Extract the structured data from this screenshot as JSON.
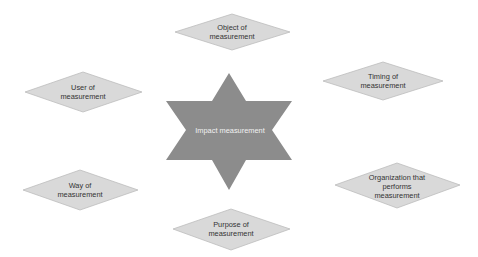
{
  "diagram": {
    "center": {
      "label": "Impact measurement",
      "shape": "six-pointed-star",
      "fill": "#8c8c8c",
      "text_color": "#f2f2f2"
    },
    "nodes": [
      {
        "id": "object",
        "label": "Object of measurement",
        "shape": "diamond"
      },
      {
        "id": "timing",
        "label": "Timing of measurement",
        "shape": "diamond"
      },
      {
        "id": "organization",
        "label": "Organization that performs measurement",
        "shape": "diamond"
      },
      {
        "id": "purpose",
        "label": "Purpose of measurement",
        "shape": "diamond"
      },
      {
        "id": "way",
        "label": "Way of measurement",
        "shape": "diamond"
      },
      {
        "id": "user",
        "label": "User of measurement",
        "shape": "diamond"
      }
    ],
    "colors": {
      "diamond_fill": "#d9d9d9",
      "diamond_stroke": "#bdbdbd",
      "node_text": "#333333"
    }
  }
}
